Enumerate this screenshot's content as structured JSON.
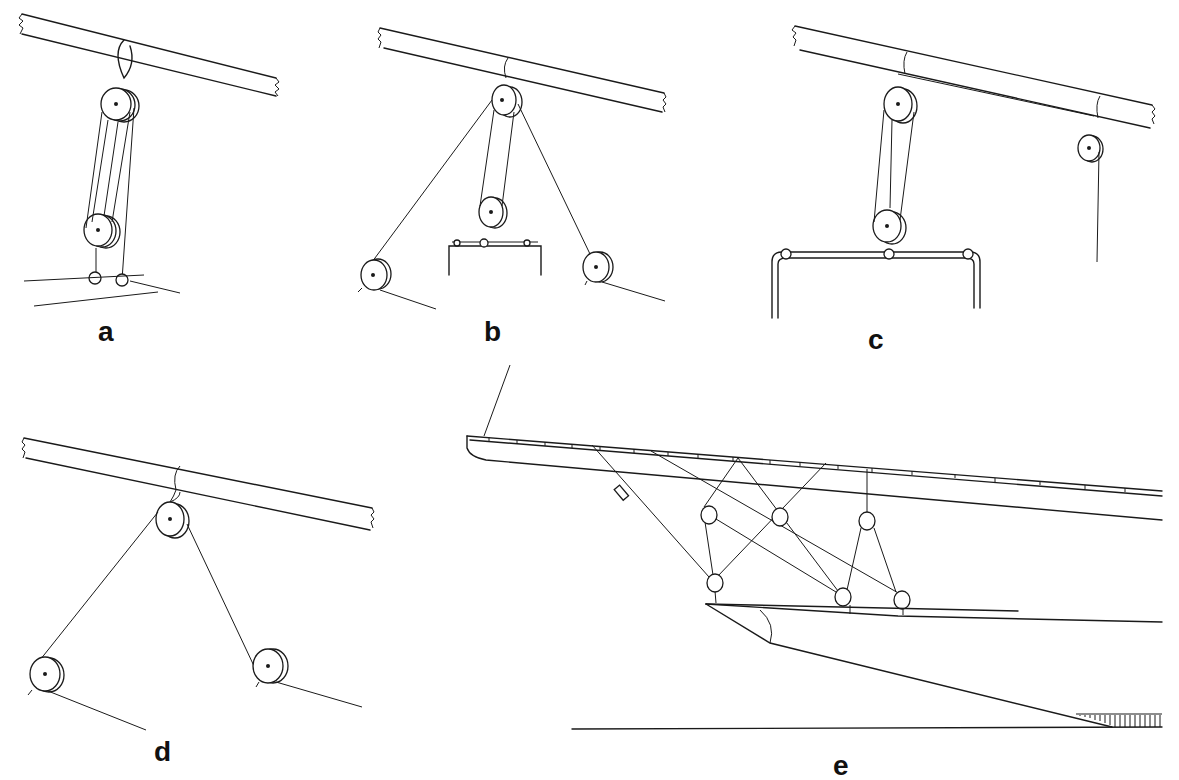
{
  "figure": {
    "panels": [
      {
        "id": "a",
        "label": "a",
        "label_pos": [
          98,
          318
        ]
      },
      {
        "id": "b",
        "label": "b",
        "label_pos": [
          484,
          318
        ]
      },
      {
        "id": "c",
        "label": "c",
        "label_pos": [
          868,
          326
        ]
      },
      {
        "id": "d",
        "label": "d",
        "label_pos": [
          154,
          738
        ]
      },
      {
        "id": "e",
        "label": "e",
        "label_pos": [
          833,
          752
        ]
      }
    ],
    "colors": {
      "ink": "#1a1a1a",
      "background": "#ffffff"
    },
    "spars": [
      {
        "panel": "a",
        "top": [
          [
            22,
            14
          ],
          [
            276,
            78
          ]
        ],
        "bottom": [
          [
            22,
            34
          ],
          [
            276,
            96
          ]
        ]
      },
      {
        "panel": "b",
        "top": [
          [
            380,
            28
          ],
          [
            664,
            93
          ]
        ],
        "bottom": [
          [
            384,
            48
          ],
          [
            662,
            112
          ]
        ]
      },
      {
        "panel": "c",
        "top": [
          [
            795,
            26
          ],
          [
            1152,
            105
          ]
        ],
        "bottom": [
          [
            800,
            50
          ],
          [
            1150,
            128
          ]
        ]
      },
      {
        "panel": "d",
        "top": [
          [
            24,
            438
          ],
          [
            372,
            508
          ]
        ],
        "bottom": [
          [
            26,
            458
          ],
          [
            370,
            530
          ]
        ]
      }
    ],
    "sheaves": [
      {
        "panel": "a",
        "cx": 118,
        "cy": 104,
        "r": 15
      },
      {
        "panel": "a",
        "cx": 100,
        "cy": 230,
        "r": 15
      },
      {
        "panel": "b",
        "cx": 504,
        "cy": 100,
        "r": 13
      },
      {
        "panel": "b",
        "cx": 491,
        "cy": 212,
        "r": 13
      },
      {
        "panel": "b",
        "cx": 374,
        "cy": 275,
        "r": 13
      },
      {
        "panel": "b",
        "cx": 596,
        "cy": 267,
        "r": 13
      },
      {
        "panel": "c",
        "cx": 898,
        "cy": 104,
        "r": 14
      },
      {
        "panel": "c",
        "cx": 887,
        "cy": 226,
        "r": 14
      },
      {
        "panel": "c",
        "cx": 1089,
        "cy": 148,
        "r": 11
      },
      {
        "panel": "d",
        "cx": 171,
        "cy": 519,
        "r": 14
      },
      {
        "panel": "d",
        "cx": 45,
        "cy": 674,
        "r": 14
      },
      {
        "panel": "d",
        "cx": 268,
        "cy": 666,
        "r": 14
      },
      {
        "panel": "e",
        "cx": 709,
        "cy": 515,
        "r": 8
      },
      {
        "panel": "e",
        "cx": 780,
        "cy": 517,
        "r": 8
      },
      {
        "panel": "e",
        "cx": 867,
        "cy": 521,
        "r": 8
      },
      {
        "panel": "e",
        "cx": 715,
        "cy": 583,
        "r": 8
      },
      {
        "panel": "e",
        "cx": 843,
        "cy": 597,
        "r": 8
      },
      {
        "panel": "e",
        "cx": 902,
        "cy": 600,
        "r": 8
      }
    ]
  }
}
